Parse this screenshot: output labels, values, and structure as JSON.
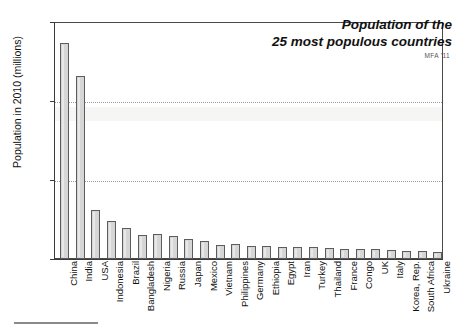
{
  "chart_data": {
    "type": "bar",
    "title": "Population of the 25 most populous countries",
    "title_lines": [
      "Population of the",
      "25 most populous countries"
    ],
    "attribution": "MFA '11",
    "xlabel": "",
    "ylabel": "Population in 2010  (millions)",
    "ylim": [
      0,
      1500
    ],
    "yticks": [
      0,
      500,
      1000,
      1500
    ],
    "ytick_labels": [
      "0",
      "500",
      "1000",
      "1500"
    ],
    "grid": "horizontal-dotted",
    "legend": "none",
    "categories": [
      "China",
      "India",
      "USA",
      "Indonesia",
      "Brazil",
      "Bangladesh",
      "Nigeria",
      "Russia",
      "Japan",
      "Mexico",
      "Vietnam",
      "Philippines",
      "Germany",
      "Ethiopia",
      "Egypt",
      "Iran",
      "Turkey",
      "Thailand",
      "France",
      "Congo",
      "UK",
      "Italy",
      "Korea, Rep.",
      "South Africa",
      "Ukraine"
    ],
    "values": [
      1370,
      1160,
      310,
      240,
      195,
      149,
      158,
      143,
      128,
      113,
      87,
      93,
      82,
      83,
      78,
      74,
      73,
      69,
      65,
      66,
      62,
      60,
      49,
      50,
      46
    ],
    "bar_fill_color": "#d6d6d6",
    "bar_edge_color": "#5c5c5c"
  }
}
